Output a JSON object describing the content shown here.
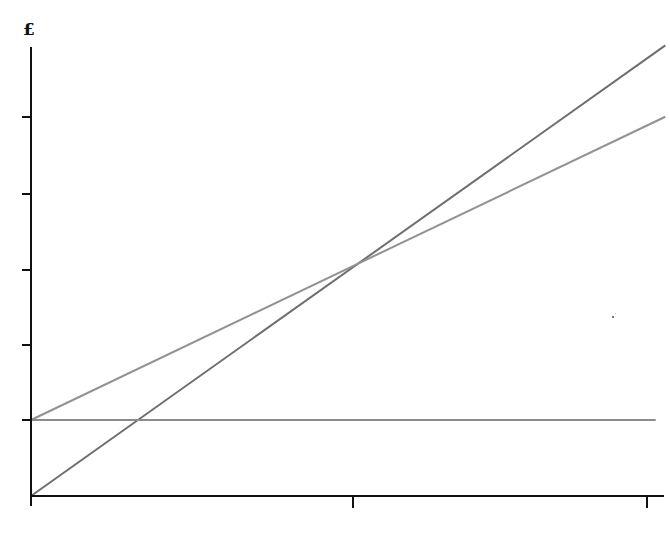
{
  "chart_data": {
    "type": "line",
    "title": "",
    "xlabel": "",
    "ylabel": "£",
    "x_ticks": [
      "",
      "",
      ""
    ],
    "y_ticks": [
      "",
      "",
      "",
      "",
      "",
      ""
    ],
    "tick_labels_visible": false,
    "xlim": [
      0,
      1.97
    ],
    "ylim": [
      0,
      6.0
    ],
    "grid": false,
    "legend": "none",
    "series": [
      {
        "name": "Total revenue",
        "color": "#6e6e6e",
        "x": [
          0,
          1.97
        ],
        "y": [
          0,
          5.93
        ]
      },
      {
        "name": "Total cost",
        "color": "#929292",
        "x": [
          0,
          1.97
        ],
        "y": [
          1.0,
          4.99
        ]
      },
      {
        "name": "Fixed cost",
        "color": "#8c8c8c",
        "x": [
          0,
          1.94
        ],
        "y": [
          1.0,
          1.0
        ]
      }
    ],
    "annotations": [
      {
        "type": "intersection",
        "label": "break-even",
        "x": 1.0,
        "y": 3.05
      }
    ]
  },
  "axis": {
    "y_label": "£"
  },
  "geometry": {
    "origin": [
      31,
      496
    ],
    "y_axis": {
      "x": 31,
      "y1": 47,
      "y2": 506
    },
    "x_axis": {
      "y": 496,
      "x1": 31,
      "x2": 664
    },
    "y_tick_px": [
      420,
      345,
      270,
      194,
      117
    ],
    "x_tick_px": [
      353,
      647
    ]
  },
  "colors": {
    "axis": "#111111",
    "revenue": "#6e6e6e",
    "cost": "#929292",
    "fixed": "#8c8c8c",
    "background": "#ffffff"
  }
}
